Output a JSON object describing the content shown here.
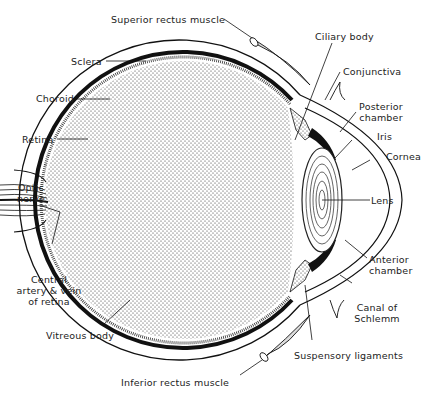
{
  "diagram": {
    "labels": {
      "superior_rectus": "Superior rectus muscle",
      "sclera": "Sclera",
      "choroid": "Choroid",
      "retina": "Retina",
      "optic_nerve_1": "Optic",
      "optic_nerve_2": "nerve",
      "central_artery_1": "Central",
      "central_artery_2": "artery & vein",
      "central_artery_3": "of retina",
      "vitreous_body": "Vitreous body",
      "inferior_rectus": "Inferior rectus muscle",
      "ciliary_body": "Ciliary body",
      "conjunctiva": "Conjunctiva",
      "posterior_chamber_1": "Posterior",
      "posterior_chamber_2": "chamber",
      "iris": "Iris",
      "cornea": "Cornea",
      "lens": "Lens",
      "anterior_chamber_1": "Anterior",
      "anterior_chamber_2": "chamber",
      "canal_schlemm_1": "Canal of",
      "canal_schlemm_2": "Schlemm",
      "suspensory_ligaments": "Suspensory ligaments"
    },
    "colors": {
      "ink": "#111111",
      "background": "#ffffff"
    }
  }
}
